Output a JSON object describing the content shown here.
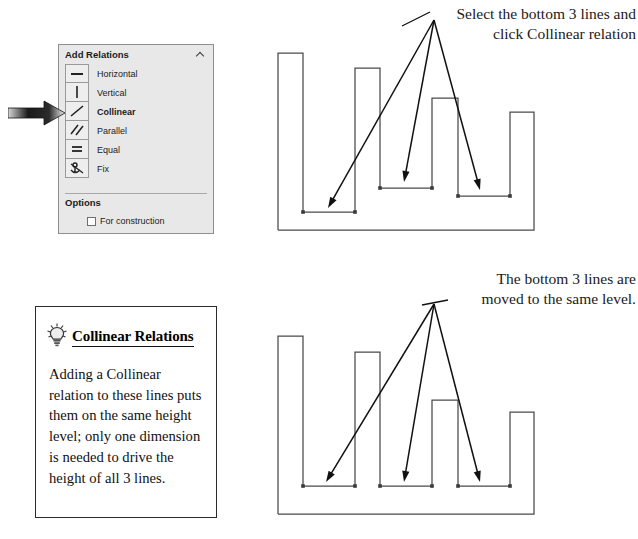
{
  "annotations": {
    "top": "Select the bottom 3 lines and\nclick Collinear relation",
    "bottom": "The bottom 3 lines are\nmoved to the same level."
  },
  "panel": {
    "title": "Add Relations",
    "collapse_icon": "chevron-up-icon",
    "relations": [
      {
        "label": "Horizontal",
        "icon": "horizontal-line-icon",
        "selected": false
      },
      {
        "label": "Vertical",
        "icon": "vertical-line-icon",
        "selected": false
      },
      {
        "label": "Collinear",
        "icon": "collinear-line-icon",
        "selected": true
      },
      {
        "label": "Parallel",
        "icon": "parallel-lines-icon",
        "selected": false
      },
      {
        "label": "Equal",
        "icon": "equal-sign-icon",
        "selected": false
      },
      {
        "label": "Fix",
        "icon": "anchor-fix-icon",
        "selected": false
      }
    ],
    "options": {
      "title": "Options",
      "collapse_icon": "chevron-up-icon",
      "for_construction": {
        "label": "For construction",
        "checked": false
      }
    },
    "pointer_icon": "right-arrow-pointer"
  },
  "tip": {
    "icon": "lightbulb-icon",
    "title": "Collinear Relations",
    "body": "Adding a Collinear relation to these lines puts them on the same height level; only one dimension is needed to drive the height of all 3 lines."
  },
  "colors": {
    "panel_bg": "#e8e8e8",
    "panel_border": "#8e8e8e",
    "sketch_line": "#4a4a4a",
    "arrow": "#111111",
    "text": "#111111",
    "point_marker": "#3a3a3a"
  },
  "chart_data": {
    "type": "diagram",
    "sketches": [
      {
        "name": "before",
        "description": "Stepped profile sketch with three bottom horizontal lines at different heights; three arrows point to them from a single origin.",
        "baseline_y": 212,
        "profile": [
          [
            16,
            212
          ],
          [
            16,
            35
          ],
          [
            41,
            35
          ],
          [
            41,
            194
          ],
          [
            93,
            194
          ],
          [
            93,
            50
          ],
          [
            118,
            50
          ],
          [
            118,
            170
          ],
          [
            170,
            170
          ],
          [
            170,
            80
          ],
          [
            196,
            80
          ],
          [
            196,
            178
          ],
          [
            248,
            178
          ],
          [
            248,
            94
          ],
          [
            272,
            94
          ],
          [
            272,
            212
          ],
          [
            16,
            212
          ]
        ],
        "selected_lines": [
          {
            "from": [
              41,
              194
            ],
            "to": [
              93,
              194
            ]
          },
          {
            "from": [
              118,
              170
            ],
            "to": [
              170,
              170
            ]
          },
          {
            "from": [
              196,
              178
            ],
            "to": [
              248,
              178
            ]
          }
        ],
        "arrow_origin": [
          172,
          2
        ],
        "arrow_tips": [
          [
            66,
            190
          ],
          [
            142,
            164
          ],
          [
            218,
            172
          ]
        ]
      },
      {
        "name": "after",
        "description": "Same profile but the three bottom horizontal lines are collinear at one common height level.",
        "baseline_y": 222,
        "common_level_y": 194,
        "profile": [
          [
            16,
            222
          ],
          [
            16,
            44
          ],
          [
            41,
            44
          ],
          [
            41,
            194
          ],
          [
            93,
            194
          ],
          [
            93,
            60
          ],
          [
            118,
            60
          ],
          [
            118,
            194
          ],
          [
            170,
            194
          ],
          [
            170,
            108
          ],
          [
            196,
            108
          ],
          [
            196,
            194
          ],
          [
            248,
            194
          ],
          [
            248,
            120
          ],
          [
            272,
            120
          ],
          [
            272,
            222
          ],
          [
            16,
            222
          ]
        ],
        "selected_lines": [
          {
            "from": [
              41,
              194
            ],
            "to": [
              93,
              194
            ]
          },
          {
            "from": [
              118,
              194
            ],
            "to": [
              170,
              194
            ]
          },
          {
            "from": [
              196,
              194
            ],
            "to": [
              248,
              194
            ]
          }
        ],
        "arrow_origin": [
          172,
          12
        ],
        "arrow_tips": [
          [
            64,
            190
          ],
          [
            142,
            190
          ],
          [
            218,
            190
          ]
        ]
      }
    ]
  }
}
